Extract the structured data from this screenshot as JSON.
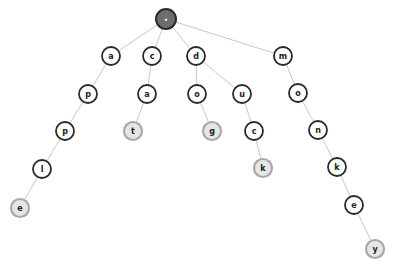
{
  "diagram": {
    "type": "trie",
    "words": [
      "apple",
      "cat",
      "dog",
      "duck",
      "monkey"
    ],
    "colors": {
      "edge": "#c8c8c8",
      "inner_stroke": "#2a2a2a",
      "inner_fill": "#ffffff",
      "leaf_stroke": "#a9a9a9",
      "leaf_fill": "#e6e6e6",
      "root_fill": "#6e6e6e"
    },
    "nodes": [
      {
        "id": "root",
        "label": "•",
        "kind": "root",
        "x": 166,
        "y": 19,
        "r": 10
      },
      {
        "id": "a",
        "label": "a",
        "kind": "inner",
        "x": 111,
        "y": 56,
        "r": 9
      },
      {
        "id": "c",
        "label": "c",
        "kind": "inner",
        "x": 152,
        "y": 56,
        "r": 9
      },
      {
        "id": "d",
        "label": "d",
        "kind": "inner",
        "x": 196,
        "y": 56,
        "r": 9
      },
      {
        "id": "m",
        "label": "m",
        "kind": "inner",
        "x": 283,
        "y": 56,
        "r": 9
      },
      {
        "id": "ap",
        "label": "p",
        "kind": "inner",
        "x": 88,
        "y": 94,
        "r": 9
      },
      {
        "id": "ca",
        "label": "a",
        "kind": "inner",
        "x": 147,
        "y": 94,
        "r": 9
      },
      {
        "id": "do",
        "label": "o",
        "kind": "inner",
        "x": 197,
        "y": 94,
        "r": 9
      },
      {
        "id": "du",
        "label": "u",
        "kind": "inner",
        "x": 242,
        "y": 94,
        "r": 9
      },
      {
        "id": "mo",
        "label": "o",
        "kind": "inner",
        "x": 298,
        "y": 93,
        "r": 9
      },
      {
        "id": "app",
        "label": "p",
        "kind": "inner",
        "x": 65,
        "y": 131,
        "r": 9
      },
      {
        "id": "cat",
        "label": "t",
        "kind": "leaf",
        "x": 133,
        "y": 131,
        "r": 9
      },
      {
        "id": "dog",
        "label": "g",
        "kind": "leaf",
        "x": 212,
        "y": 131,
        "r": 9
      },
      {
        "id": "duc",
        "label": "c",
        "kind": "inner",
        "x": 254,
        "y": 131,
        "r": 9
      },
      {
        "id": "mon",
        "label": "n",
        "kind": "inner",
        "x": 318,
        "y": 130,
        "r": 9
      },
      {
        "id": "appl",
        "label": "l",
        "kind": "inner",
        "x": 42,
        "y": 169,
        "r": 9
      },
      {
        "id": "duck",
        "label": "k",
        "kind": "leaf",
        "x": 263,
        "y": 168,
        "r": 9
      },
      {
        "id": "monk",
        "label": "k",
        "kind": "inner",
        "x": 337,
        "y": 167,
        "r": 9
      },
      {
        "id": "apple",
        "label": "e",
        "kind": "leaf",
        "x": 20,
        "y": 208,
        "r": 9
      },
      {
        "id": "monke",
        "label": "e",
        "kind": "inner",
        "x": 354,
        "y": 205,
        "r": 9
      },
      {
        "id": "monkey",
        "label": "y",
        "kind": "leaf",
        "x": 375,
        "y": 249,
        "r": 9
      }
    ],
    "edges": [
      [
        "root",
        "a"
      ],
      [
        "root",
        "c"
      ],
      [
        "root",
        "d"
      ],
      [
        "root",
        "m"
      ],
      [
        "a",
        "ap"
      ],
      [
        "ap",
        "app"
      ],
      [
        "app",
        "appl"
      ],
      [
        "appl",
        "apple"
      ],
      [
        "c",
        "ca"
      ],
      [
        "ca",
        "cat"
      ],
      [
        "d",
        "do"
      ],
      [
        "do",
        "dog"
      ],
      [
        "d",
        "du"
      ],
      [
        "du",
        "duc"
      ],
      [
        "duc",
        "duck"
      ],
      [
        "m",
        "mo"
      ],
      [
        "mo",
        "mon"
      ],
      [
        "mon",
        "monk"
      ],
      [
        "monk",
        "monke"
      ],
      [
        "monke",
        "monkey"
      ]
    ]
  }
}
